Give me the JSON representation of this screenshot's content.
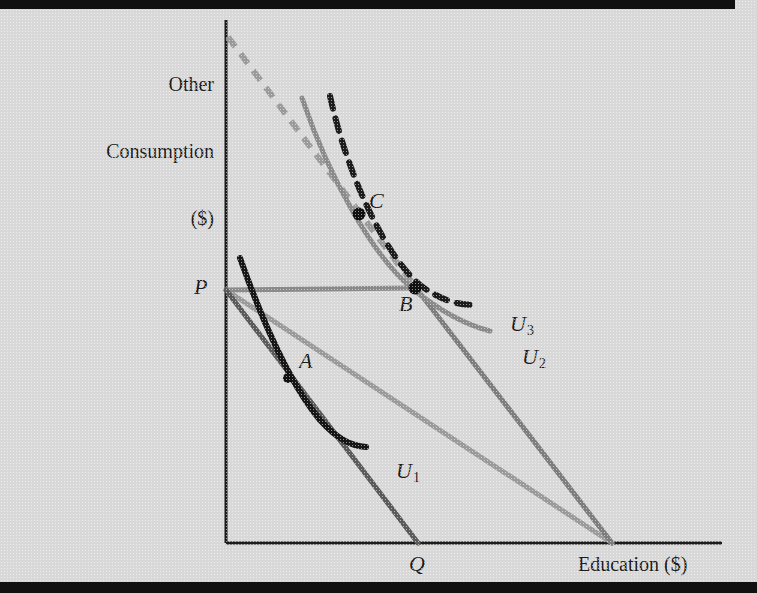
{
  "figure": {
    "type": "economics-indifference-curve-diagram",
    "title_visible": false,
    "axes": {
      "y_label": "Other\nConsumption\n($)",
      "x_label": "Education ($)",
      "origin_label": "",
      "y_axis_x_px": 226,
      "x_axis_y_px": 543,
      "x_axis_end_px": 722,
      "y_axis_top_px": 20
    },
    "points": [
      {
        "id": "A",
        "label": "A",
        "x": 288,
        "y": 378,
        "dot": true,
        "dot_r": 5,
        "label_dx": 14,
        "label_dy": -26
      },
      {
        "id": "B",
        "label": "B",
        "x": 415,
        "y": 288,
        "dot": true,
        "dot_r": 6.5,
        "label_dx": -22,
        "label_dy": 6
      },
      {
        "id": "C",
        "label": "C",
        "x": 359,
        "y": 214,
        "dot": true,
        "dot_r": 6.5,
        "label_dx": 11,
        "label_dy": -28
      },
      {
        "id": "P",
        "label": "P",
        "x": 226,
        "y": 290,
        "dot": false,
        "dot_r": 0,
        "label_dx": -24,
        "label_dy": -9
      },
      {
        "id": "Q",
        "label": "Q",
        "x": 418,
        "y": 543,
        "dot": false,
        "dot_r": 0,
        "label_dx": -8,
        "label_dy": 12
      }
    ],
    "curves": [
      {
        "id": "U1",
        "label": "U",
        "sublabel": "1",
        "style": "solid",
        "color": "#161616",
        "width": 6,
        "label_x": 374,
        "label_y": 434,
        "path": "M 240 258 C 262 320, 290 384, 320 420 C 338 440, 352 446, 366 447"
      },
      {
        "id": "U2",
        "label": "U",
        "sublabel": "2",
        "style": "solid",
        "color": "#8a8a8a",
        "width": 5,
        "label_x": 500,
        "label_y": 320,
        "path": "M 302 98 C 330 180, 374 258, 414 290 C 444 314, 470 326, 490 331"
      },
      {
        "id": "U3",
        "label": "U",
        "sublabel": "3",
        "style": "dashed",
        "color": "#1c1c1c",
        "width": 6,
        "dash": "13 10",
        "label_x": 488,
        "label_y": 287,
        "path": "M 330 96 C 348 178, 388 262, 424 288 C 448 304, 464 305, 478 305"
      }
    ],
    "lines": [
      {
        "id": "budget-line-initial",
        "from": "P",
        "to": "Q",
        "color": "#5a5a5a",
        "width": 5,
        "style": "solid",
        "x1": 226,
        "y1": 290,
        "x2": 418,
        "y2": 543
      },
      {
        "id": "subsidized-budget-line",
        "from": "P",
        "to": "x-axis",
        "color": "#9a9a9a",
        "width": 5,
        "style": "solid",
        "x1": 226,
        "y1": 290,
        "x2": 612,
        "y2": 543
      },
      {
        "id": "horizontal-income-line-P-to-B",
        "from": "P",
        "to": "B",
        "color": "#8a8a8a",
        "width": 5,
        "style": "solid",
        "x1": 226,
        "y1": 290,
        "x2": 416,
        "y2": 288
      },
      {
        "id": "shifted-budget-line-dashed-extension",
        "from": "y-axis-top",
        "to": "B",
        "color": "#9a9a9a",
        "width": 6,
        "style": "dashed",
        "dash": "12 9",
        "x1": 228,
        "y1": 37,
        "x2": 416,
        "y2": 288
      },
      {
        "id": "shifted-budget-line-solid-lower",
        "from": "B",
        "to": "x-axis",
        "color": "#7d7d7d",
        "width": 5,
        "style": "solid",
        "x1": 416,
        "y1": 288,
        "x2": 612,
        "y2": 543
      }
    ],
    "colors": {
      "background": "#d8d8d8",
      "frame_bar": "#111111",
      "axis": "#1c1c1c",
      "dark_curve": "#161616",
      "gray_curve": "#8a8a8a",
      "gray_line": "#9a9a9a",
      "dark_gray_line": "#5a5a5a"
    }
  }
}
